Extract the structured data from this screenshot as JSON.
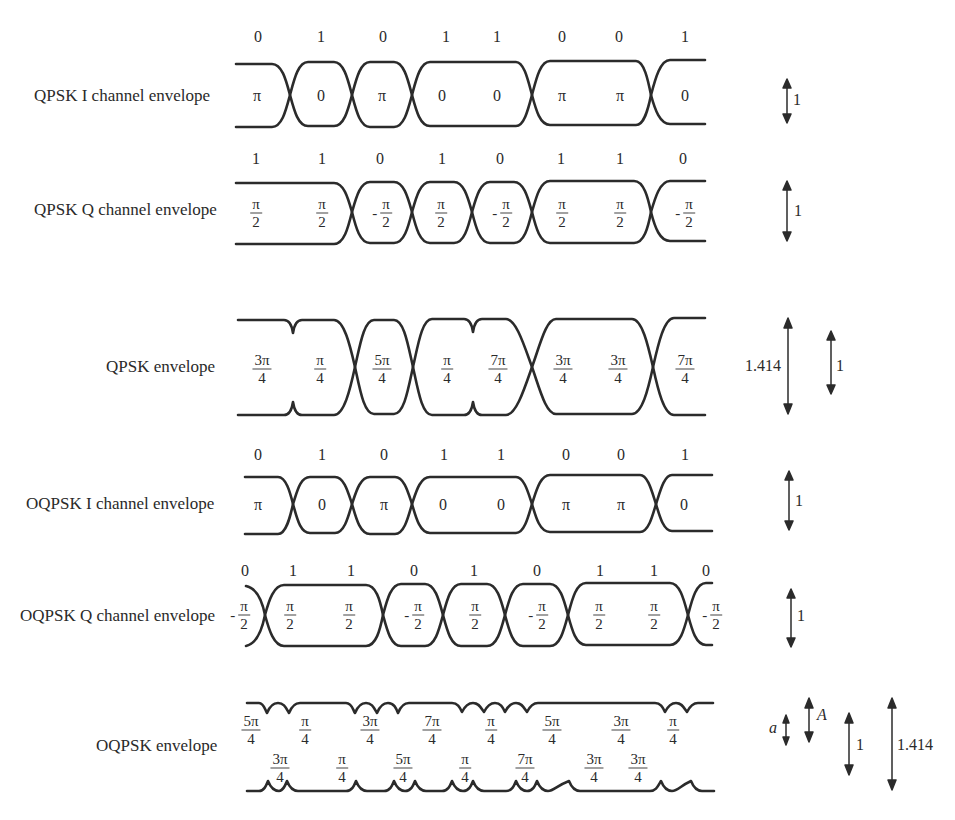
{
  "figure": {
    "rows": [
      {
        "id": "qpsk-i",
        "label": "QPSK I channel envelope",
        "bits": [
          "0",
          "1",
          "0",
          "1",
          "1",
          "0",
          "0",
          "1"
        ],
        "phases": [
          {
            "num": "π",
            "den": "",
            "neg": false
          },
          {
            "num": "0",
            "den": "",
            "neg": false
          },
          {
            "num": "π",
            "den": "",
            "neg": false
          },
          {
            "num": "0",
            "den": "",
            "neg": false
          },
          {
            "num": "0",
            "den": "",
            "neg": false
          },
          {
            "num": "π",
            "den": "",
            "neg": false
          },
          {
            "num": "π",
            "den": "",
            "neg": false
          },
          {
            "num": "0",
            "den": "",
            "neg": false
          }
        ],
        "scale": [
          "1"
        ]
      },
      {
        "id": "qpsk-q",
        "label": "QPSK Q channel envelope",
        "bits": [
          "1",
          "1",
          "0",
          "1",
          "0",
          "1",
          "1",
          "0"
        ],
        "phases": [
          {
            "num": "π",
            "den": "2",
            "neg": false
          },
          {
            "num": "π",
            "den": "2",
            "neg": false
          },
          {
            "num": "π",
            "den": "2",
            "neg": true
          },
          {
            "num": "π",
            "den": "2",
            "neg": false
          },
          {
            "num": "π",
            "den": "2",
            "neg": true
          },
          {
            "num": "π",
            "den": "2",
            "neg": false
          },
          {
            "num": "π",
            "den": "2",
            "neg": false
          },
          {
            "num": "π",
            "den": "2",
            "neg": true
          }
        ],
        "scale": [
          "1"
        ]
      },
      {
        "id": "qpsk-env",
        "label": "QPSK envelope",
        "bits": [],
        "phases": [
          {
            "num": "3π",
            "den": "4",
            "neg": false
          },
          {
            "num": "π",
            "den": "4",
            "neg": false
          },
          {
            "num": "5π",
            "den": "4",
            "neg": false
          },
          {
            "num": "π",
            "den": "4",
            "neg": false
          },
          {
            "num": "7π",
            "den": "4",
            "neg": false
          },
          {
            "num": "3π",
            "den": "4",
            "neg": false
          },
          {
            "num": "3π",
            "den": "4",
            "neg": false
          },
          {
            "num": "7π",
            "den": "4",
            "neg": false
          }
        ],
        "scale": [
          "1.414",
          "1"
        ]
      },
      {
        "id": "oqpsk-i",
        "label": "OQPSK I channel envelope",
        "bits": [
          "0",
          "1",
          "0",
          "1",
          "1",
          "0",
          "0",
          "1"
        ],
        "phases": [
          {
            "num": "π",
            "den": "",
            "neg": false
          },
          {
            "num": "0",
            "den": "",
            "neg": false
          },
          {
            "num": "π",
            "den": "",
            "neg": false
          },
          {
            "num": "0",
            "den": "",
            "neg": false
          },
          {
            "num": "0",
            "den": "",
            "neg": false
          },
          {
            "num": "π",
            "den": "",
            "neg": false
          },
          {
            "num": "π",
            "den": "",
            "neg": false
          },
          {
            "num": "0",
            "den": "",
            "neg": false
          }
        ],
        "scale": [
          "1"
        ]
      },
      {
        "id": "oqpsk-q",
        "label": "OQPSK Q channel envelope",
        "bits": [
          "0",
          "1",
          "1",
          "0",
          "1",
          "0",
          "1",
          "1",
          "0"
        ],
        "phases": [
          {
            "num": "π",
            "den": "2",
            "neg": true
          },
          {
            "num": "π",
            "den": "2",
            "neg": false
          },
          {
            "num": "π",
            "den": "2",
            "neg": false
          },
          {
            "num": "π",
            "den": "2",
            "neg": true
          },
          {
            "num": "π",
            "den": "2",
            "neg": false
          },
          {
            "num": "π",
            "den": "2",
            "neg": true
          },
          {
            "num": "π",
            "den": "2",
            "neg": false
          },
          {
            "num": "π",
            "den": "2",
            "neg": false
          },
          {
            "num": "π",
            "den": "2",
            "neg": true
          }
        ],
        "scale": [
          "1"
        ]
      },
      {
        "id": "oqpsk-env",
        "label": "OQPSK envelope",
        "phases_upper": [
          {
            "num": "5π",
            "den": "4"
          },
          {
            "num": "π",
            "den": "4"
          },
          {
            "num": "3π",
            "den": "4"
          },
          {
            "num": "7π",
            "den": "4"
          },
          {
            "num": "π",
            "den": "4"
          },
          {
            "num": "5π",
            "den": "4"
          },
          {
            "num": "3π",
            "den": "4"
          },
          {
            "num": "π",
            "den": "4"
          }
        ],
        "phases_lower": [
          {
            "num": "3π",
            "den": "4"
          },
          {
            "num": "π",
            "den": "4"
          },
          {
            "num": "5π",
            "den": "4"
          },
          {
            "num": "π",
            "den": "4"
          },
          {
            "num": "7π",
            "den": "4"
          },
          {
            "num": "3π",
            "den": "4"
          },
          {
            "num": "3π",
            "den": "4"
          }
        ],
        "scale": [
          "a",
          "A",
          "1",
          "1.414"
        ]
      }
    ]
  }
}
